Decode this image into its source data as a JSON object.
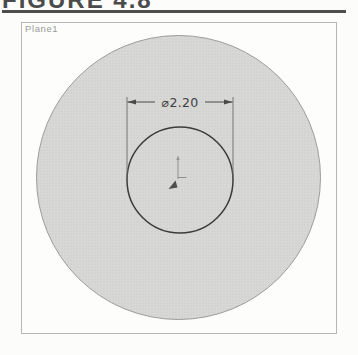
{
  "figure": {
    "heading": "FIGURE 4.8"
  },
  "viewport": {
    "plane_label": "Plane1"
  },
  "sketch": {
    "dimension": {
      "label": "⌀2.20",
      "symbol": "⌀",
      "value": "2.20"
    },
    "origin_marker": "sketch-origin"
  },
  "colors": {
    "page_background": "#fcfcfb",
    "heading_text": "#4b4b4b",
    "heading_rule": "#4e4e4e",
    "viewport_border": "#b6b6b4",
    "plane_label_text": "#9b9b98",
    "shaded_fill": "#d8d8d6",
    "halftone_dot": "#c2c2c0",
    "outer_circle_stroke": "#9c9c9c",
    "inner_circle_stroke": "#3c3c3c",
    "dimension_color": "#3f3f3f",
    "origin_marker_color": "#8f8f8f",
    "origin_arrowhead_color": "#4f4f4f"
  }
}
